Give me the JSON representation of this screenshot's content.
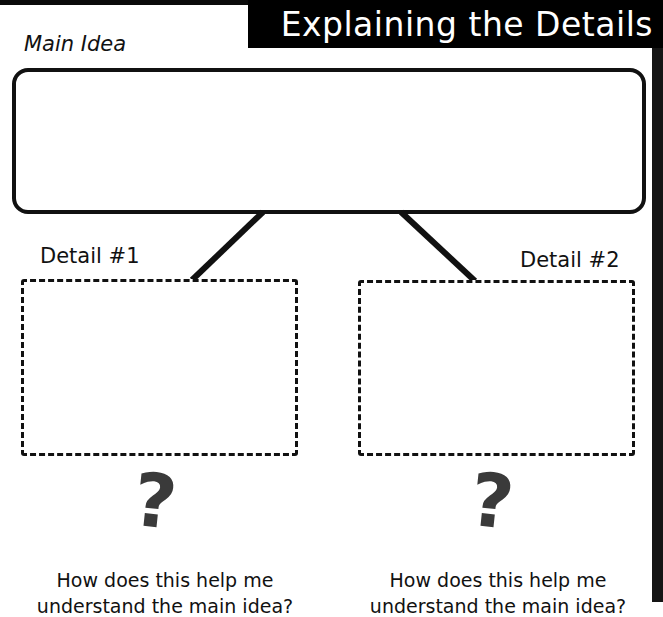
{
  "header": {
    "title": "Explaining the Details"
  },
  "main_idea": {
    "label": "Main Idea",
    "content": ""
  },
  "details": [
    {
      "label": "Detail #1",
      "content": "",
      "question_mark": "?",
      "question_line1": "How does this help me",
      "question_line2": "understand the main idea?"
    },
    {
      "label": "Detail #2",
      "content": "",
      "question_mark": "?",
      "question_line1": "How does this help me",
      "question_line2": "understand the main idea?"
    }
  ],
  "colors": {
    "banner_bg": "#000000",
    "banner_text": "#ffffff",
    "border": "#111111",
    "question_mark": "#3a3a3a"
  }
}
